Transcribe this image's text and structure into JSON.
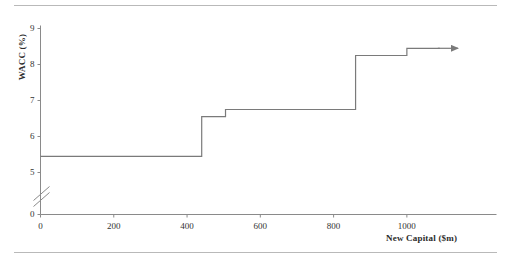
{
  "chart_data": {
    "type": "line",
    "subtype": "step",
    "title": "",
    "xlabel": "New Capital ($m)",
    "ylabel": "WACC (%)",
    "xlim": [
      0,
      1130
    ],
    "ylim_display": [
      0,
      9
    ],
    "y_axis_break": true,
    "y_break_between": [
      0,
      5
    ],
    "xticks": [
      0,
      200,
      400,
      600,
      800,
      1000
    ],
    "xtick_labels": [
      "0",
      "200",
      "400",
      "600",
      "800",
      "1000"
    ],
    "yticks": [
      0,
      5,
      6,
      7,
      8,
      9
    ],
    "ytick_labels": [
      "0",
      "5",
      "6",
      "7",
      "8",
      "9"
    ],
    "grid": false,
    "legend": false,
    "line_color": "#7a7a7a",
    "axis_color": "#8a8a8a",
    "series": [
      {
        "name": "Marginal cost of capital",
        "steps": [
          {
            "x_start": 0,
            "x_end": 440,
            "y": 5.45
          },
          {
            "x_start": 440,
            "x_end": 505,
            "y": 6.55
          },
          {
            "x_start": 505,
            "x_end": 860,
            "y": 6.75
          },
          {
            "x_start": 860,
            "x_end": 1000,
            "y": 8.25
          },
          {
            "x_start": 1000,
            "x_end": 1090,
            "y": 8.45
          }
        ]
      }
    ],
    "annotations": [
      {
        "type": "arrow",
        "at_x": 1090,
        "at_y": 8.45,
        "direction": "right"
      }
    ]
  },
  "axis": {
    "y_title": "WACC (%)",
    "x_title": "New Capital ($m)"
  }
}
